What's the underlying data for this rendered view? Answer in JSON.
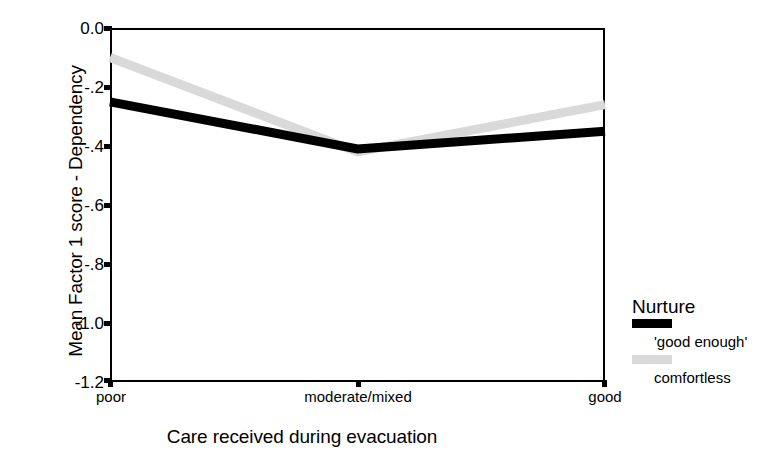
{
  "chart_data": {
    "type": "line",
    "title": "",
    "xlabel": "Care received during evacuation",
    "ylabel": "Mean Factor 1 score - Dependency",
    "categories": [
      "poor",
      "moderate/mixed",
      "good"
    ],
    "ylim": [
      -1.2,
      0.0
    ],
    "yticks": [
      "0.0",
      "-.2",
      "-.4",
      "-.6",
      "-.8",
      "-1.0",
      "-1.2"
    ],
    "ytick_values": [
      0.0,
      -0.2,
      -0.4,
      -0.6,
      -0.8,
      -1.0,
      -1.2
    ],
    "grid": false,
    "legend_position": "right",
    "legend_title": "Nurture",
    "series": [
      {
        "name": "'good enough'",
        "color": "#000000",
        "values": [
          -0.25,
          -0.41,
          -0.35
        ]
      },
      {
        "name": "comfortless",
        "color": "#d9d9d9",
        "values": [
          -0.1,
          -0.42,
          -0.26
        ]
      }
    ]
  },
  "axes": {
    "y_title": "Mean Factor 1 score - Dependency",
    "x_title": "Care received during evacuation",
    "y_tick_labels": [
      "0.0",
      "-.2",
      "-.4",
      "-.6",
      "-.8",
      "-1.0",
      "-1.2"
    ],
    "x_tick_labels": [
      "poor",
      "moderate/mixed",
      "good"
    ]
  },
  "legend": {
    "title": "Nurture",
    "entries": [
      {
        "label": "'good enough'",
        "color": "#000000"
      },
      {
        "label": "comfortless",
        "color": "#d9d9d9"
      }
    ]
  }
}
